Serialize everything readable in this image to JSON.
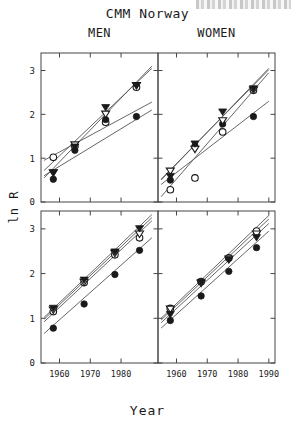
{
  "figure": {
    "title": "CMM Norway",
    "xlabel": "Year",
    "ylabel": "ln R",
    "col_titles": {
      "left": "MEN",
      "right": "WOMEN"
    }
  },
  "axes": {
    "x_ticks": [
      1960,
      1970,
      1980,
      1990
    ],
    "x_tick_labels_left": [
      "1960",
      "1970",
      "1980"
    ],
    "x_tick_labels_right": [
      "1960",
      "1970",
      "1980",
      "1990"
    ],
    "y_ticks": [
      0,
      1,
      2,
      3
    ],
    "y_tick_labels": [
      "0",
      "1",
      "2",
      "3"
    ],
    "xlim": [
      1954,
      1992
    ],
    "ylim": [
      0,
      3.4
    ],
    "grid": false
  },
  "chart_data": [
    {
      "type": "scatter",
      "title": "MEN",
      "panel": "top-left",
      "xlabel": "Year",
      "ylabel": "ln R",
      "xlim": [
        1954,
        1992
      ],
      "ylim": [
        0,
        3.4
      ],
      "x_ticks": [
        1960,
        1970,
        1980
      ],
      "y_ticks": [
        0,
        1,
        2,
        3
      ],
      "grid": false,
      "series": [
        {
          "name": "open-circle",
          "marker": "circle-open",
          "x": [
            1958,
            1965,
            1975,
            1985
          ],
          "y": [
            1.02,
            1.27,
            1.82,
            2.62
          ],
          "fit": {
            "x": [
              1955,
              1990
            ],
            "y": [
              0.72,
              3.05
            ]
          }
        },
        {
          "name": "filled-circle",
          "marker": "circle-filled",
          "x": [
            1958,
            1965,
            1975,
            1985
          ],
          "y": [
            0.52,
            1.18,
            1.88,
            1.95
          ],
          "fit": {
            "x": [
              1955,
              1990
            ],
            "y": [
              0.6,
              2.1
            ]
          }
        },
        {
          "name": "open-triangle",
          "marker": "triangle-down-open",
          "x": [
            1958,
            1965,
            1975,
            1985
          ],
          "y": [
            0.66,
            1.3,
            2.0,
            2.65
          ],
          "fit": {
            "x": [
              1955,
              1990
            ],
            "y": [
              0.55,
              3.1
            ]
          }
        },
        {
          "name": "filled-triangle",
          "marker": "triangle-down-filled",
          "x": [
            1958,
            1965,
            1975,
            1985
          ],
          "y": [
            0.66,
            1.25,
            2.15,
            2.65
          ],
          "fit": {
            "x": [
              1955,
              1990
            ],
            "y": [
              0.95,
              2.28
            ]
          }
        }
      ]
    },
    {
      "type": "scatter",
      "title": "WOMEN",
      "panel": "top-right",
      "xlabel": "Year",
      "ylabel": "ln R",
      "xlim": [
        1954,
        1992
      ],
      "ylim": [
        0,
        3.4
      ],
      "x_ticks": [
        1960,
        1970,
        1980,
        1990
      ],
      "y_ticks": [
        0,
        1,
        2,
        3
      ],
      "grid": false,
      "series": [
        {
          "name": "open-circle",
          "marker": "circle-open",
          "x": [
            1958,
            1966,
            1975,
            1985
          ],
          "y": [
            0.28,
            0.55,
            1.6,
            2.55
          ],
          "fit": {
            "x": [
              1955,
              1990
            ],
            "y": [
              0.12,
              2.95
            ]
          }
        },
        {
          "name": "filled-circle",
          "marker": "circle-filled",
          "x": [
            1958,
            1966,
            1975,
            1985
          ],
          "y": [
            0.5,
            1.28,
            1.78,
            1.95
          ],
          "fit": {
            "x": [
              1955,
              1990
            ],
            "y": [
              0.4,
              2.3
            ]
          }
        },
        {
          "name": "open-triangle",
          "marker": "triangle-down-open",
          "x": [
            1958,
            1966,
            1975,
            1985
          ],
          "y": [
            0.7,
            1.2,
            1.85,
            2.55
          ],
          "fit": {
            "x": [
              1955,
              1990
            ],
            "y": [
              0.52,
              3.02
            ]
          }
        },
        {
          "name": "filled-triangle",
          "marker": "triangle-down-filled",
          "x": [
            1958,
            1966,
            1975,
            1985
          ],
          "y": [
            0.58,
            1.32,
            2.05,
            2.58
          ],
          "fit": {
            "x": [
              1955,
              1990
            ],
            "y": [
              0.5,
              3.05
            ]
          }
        }
      ]
    },
    {
      "type": "scatter",
      "title": "MEN",
      "panel": "bottom-left",
      "xlabel": "Year",
      "ylabel": "ln R",
      "xlim": [
        1954,
        1992
      ],
      "ylim": [
        0,
        3.4
      ],
      "x_ticks": [
        1960,
        1970,
        1980
      ],
      "y_ticks": [
        0,
        1,
        2,
        3
      ],
      "grid": false,
      "series": [
        {
          "name": "open-circle",
          "marker": "circle-open",
          "x": [
            1958,
            1968,
            1978,
            1986
          ],
          "y": [
            1.15,
            1.8,
            2.42,
            2.8
          ],
          "fit": {
            "x": [
              1955,
              1990
            ],
            "y": [
              0.92,
              3.18
            ]
          }
        },
        {
          "name": "filled-circle",
          "marker": "circle-filled",
          "x": [
            1958,
            1968,
            1978,
            1986
          ],
          "y": [
            0.78,
            1.32,
            1.98,
            2.52
          ],
          "fit": {
            "x": [
              1955,
              1990
            ],
            "y": [
              0.66,
              2.8
            ]
          }
        },
        {
          "name": "open-triangle",
          "marker": "triangle-down-open",
          "x": [
            1958,
            1968,
            1978,
            1986
          ],
          "y": [
            1.18,
            1.8,
            2.45,
            2.88
          ],
          "fit": {
            "x": [
              1955,
              1990
            ],
            "y": [
              0.98,
              3.25
            ]
          }
        },
        {
          "name": "filled-triangle",
          "marker": "triangle-down-filled",
          "x": [
            1958,
            1968,
            1978,
            1986
          ],
          "y": [
            1.22,
            1.85,
            2.48,
            3.0
          ],
          "fit": {
            "x": [
              1955,
              1990
            ],
            "y": [
              1.02,
              3.32
            ]
          }
        }
      ]
    },
    {
      "type": "scatter",
      "title": "WOMEN",
      "panel": "bottom-right",
      "xlabel": "Year",
      "ylabel": "ln R",
      "xlim": [
        1954,
        1992
      ],
      "ylim": [
        0,
        3.4
      ],
      "x_ticks": [
        1960,
        1970,
        1980,
        1990
      ],
      "y_ticks": [
        0,
        1,
        2,
        3
      ],
      "grid": false,
      "series": [
        {
          "name": "open-circle",
          "marker": "circle-open",
          "x": [
            1958,
            1968,
            1977,
            1986
          ],
          "y": [
            1.22,
            1.82,
            2.35,
            2.95
          ],
          "fit": {
            "x": [
              1955,
              1990
            ],
            "y": [
              1.0,
              3.3
            ]
          }
        },
        {
          "name": "filled-circle",
          "marker": "circle-filled",
          "x": [
            1958,
            1968,
            1977,
            1986
          ],
          "y": [
            0.95,
            1.5,
            2.05,
            2.58
          ],
          "fit": {
            "x": [
              1955,
              1990
            ],
            "y": [
              0.78,
              2.95
            ]
          }
        },
        {
          "name": "open-triangle",
          "marker": "triangle-down-open",
          "x": [
            1958,
            1968,
            1977,
            1986
          ],
          "y": [
            1.2,
            1.78,
            2.32,
            2.88
          ],
          "fit": {
            "x": [
              1955,
              1990
            ],
            "y": [
              0.96,
              3.22
            ]
          }
        },
        {
          "name": "filled-triangle",
          "marker": "triangle-down-filled",
          "x": [
            1958,
            1968,
            1977,
            1986
          ],
          "y": [
            1.08,
            1.8,
            2.3,
            2.8
          ],
          "fit": {
            "x": [
              1955,
              1990
            ],
            "y": [
              0.9,
              3.12
            ]
          }
        }
      ]
    }
  ],
  "colors": {
    "ink": "#1a1a1a",
    "line": "#555555",
    "frame": "#444444",
    "background": "#ffffff"
  }
}
